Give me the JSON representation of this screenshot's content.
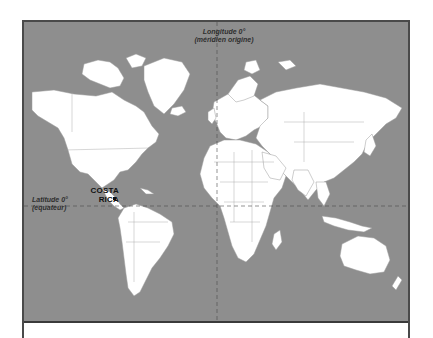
{
  "map": {
    "title": "World map (Mercator) with Costa Rica highlighted",
    "colors": {
      "ocean": "#8e8e8e",
      "land": "#ffffff",
      "borders": "#9a9a9a",
      "frame": "#4a4a4a",
      "reference_lines": "#4a4a4a"
    },
    "reference_lines": {
      "meridian": {
        "label_line1": "Longitude 0°",
        "label_line2": "(méridien origine)"
      },
      "equator": {
        "label_line1": "Latitude 0°",
        "label_line2": "(équateur)"
      }
    },
    "highlighted_country": {
      "name_line1": "COSTA",
      "name_line2": "RICA"
    }
  }
}
